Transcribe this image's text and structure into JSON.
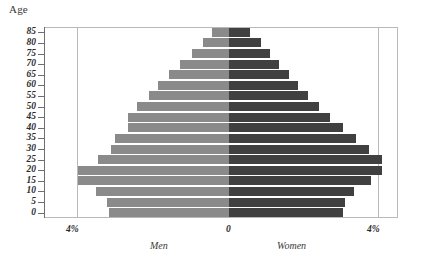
{
  "chart_data": {
    "type": "bar",
    "subtype": "population-pyramid",
    "title": "",
    "ylabel": "Age",
    "xlabel": "",
    "grid": true,
    "legend_position": "below-axis",
    "axis": {
      "y_title": "Age",
      "y_ticks": [
        "85",
        "80",
        "75",
        "70",
        "65",
        "60",
        "55",
        "50",
        "45",
        "40",
        "35",
        "30",
        "25",
        "20",
        "15",
        "10",
        "5",
        "0"
      ],
      "x_ticks_left": "4%",
      "x_ticks_center": "0",
      "x_ticks_right": "4%",
      "xlim_percent": [
        4,
        0,
        4
      ]
    },
    "categories": [
      "0",
      "5",
      "10",
      "15",
      "20",
      "25",
      "30",
      "35",
      "40",
      "45",
      "50",
      "55",
      "60",
      "65",
      "70",
      "75",
      "80",
      "85"
    ],
    "series": [
      {
        "name": "Men",
        "side": "left",
        "color": "#8a8a8a",
        "values": [
          3.2,
          3.25,
          3.55,
          4.05,
          4.05,
          3.5,
          3.15,
          3.05,
          2.7,
          2.7,
          2.45,
          2.15,
          1.9,
          1.6,
          1.3,
          1.0,
          0.7,
          0.45
        ]
      },
      {
        "name": "Women",
        "side": "right",
        "color": "#404040",
        "values": [
          3.05,
          3.1,
          3.35,
          3.8,
          4.1,
          4.1,
          3.75,
          3.4,
          3.05,
          2.7,
          2.4,
          2.1,
          1.85,
          1.6,
          1.35,
          1.1,
          0.85,
          0.55
        ]
      }
    ],
    "labels": {
      "men": "Men",
      "women": "Women",
      "left_pct": "4%",
      "center_pct": "0",
      "right_pct": "4%"
    },
    "geometry": {
      "frame_left": 44,
      "frame_right": 398,
      "frame_top": 27,
      "frame_bottom": 218,
      "center_x": 229,
      "px_per_percent": 37.4,
      "band_height": 10.6,
      "bar_height": 9
    }
  }
}
